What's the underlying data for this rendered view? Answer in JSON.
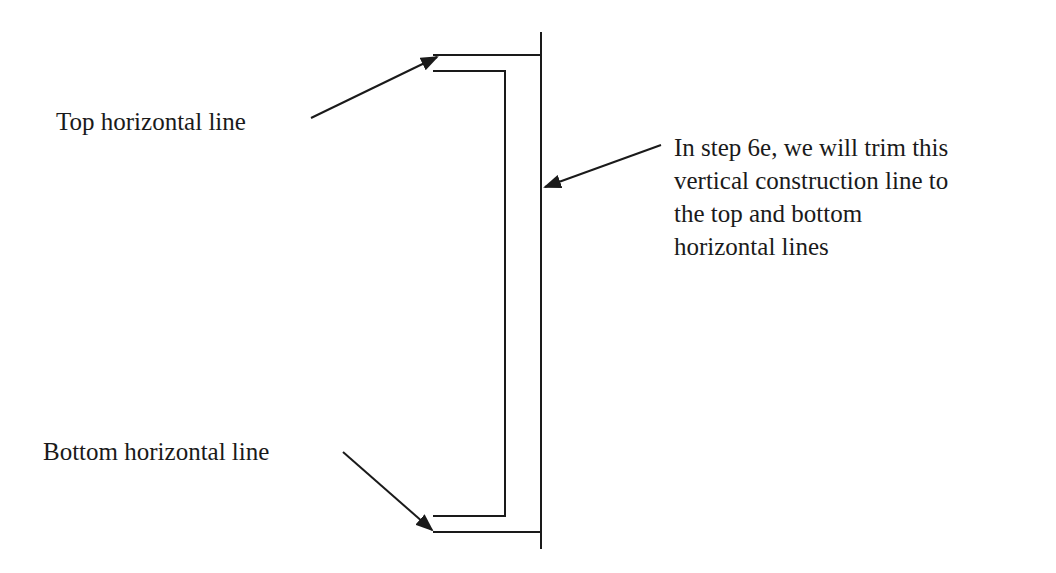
{
  "diagram": {
    "labels": {
      "top": "Top horizontal line",
      "bottom": "Bottom horizontal line",
      "note_lines": [
        "In step 6e, we will trim this",
        "vertical construction line to",
        "the top and bottom",
        "horizontal lines"
      ]
    },
    "colors": {
      "line": "#1a1a1a",
      "background": "#ffffff"
    }
  }
}
